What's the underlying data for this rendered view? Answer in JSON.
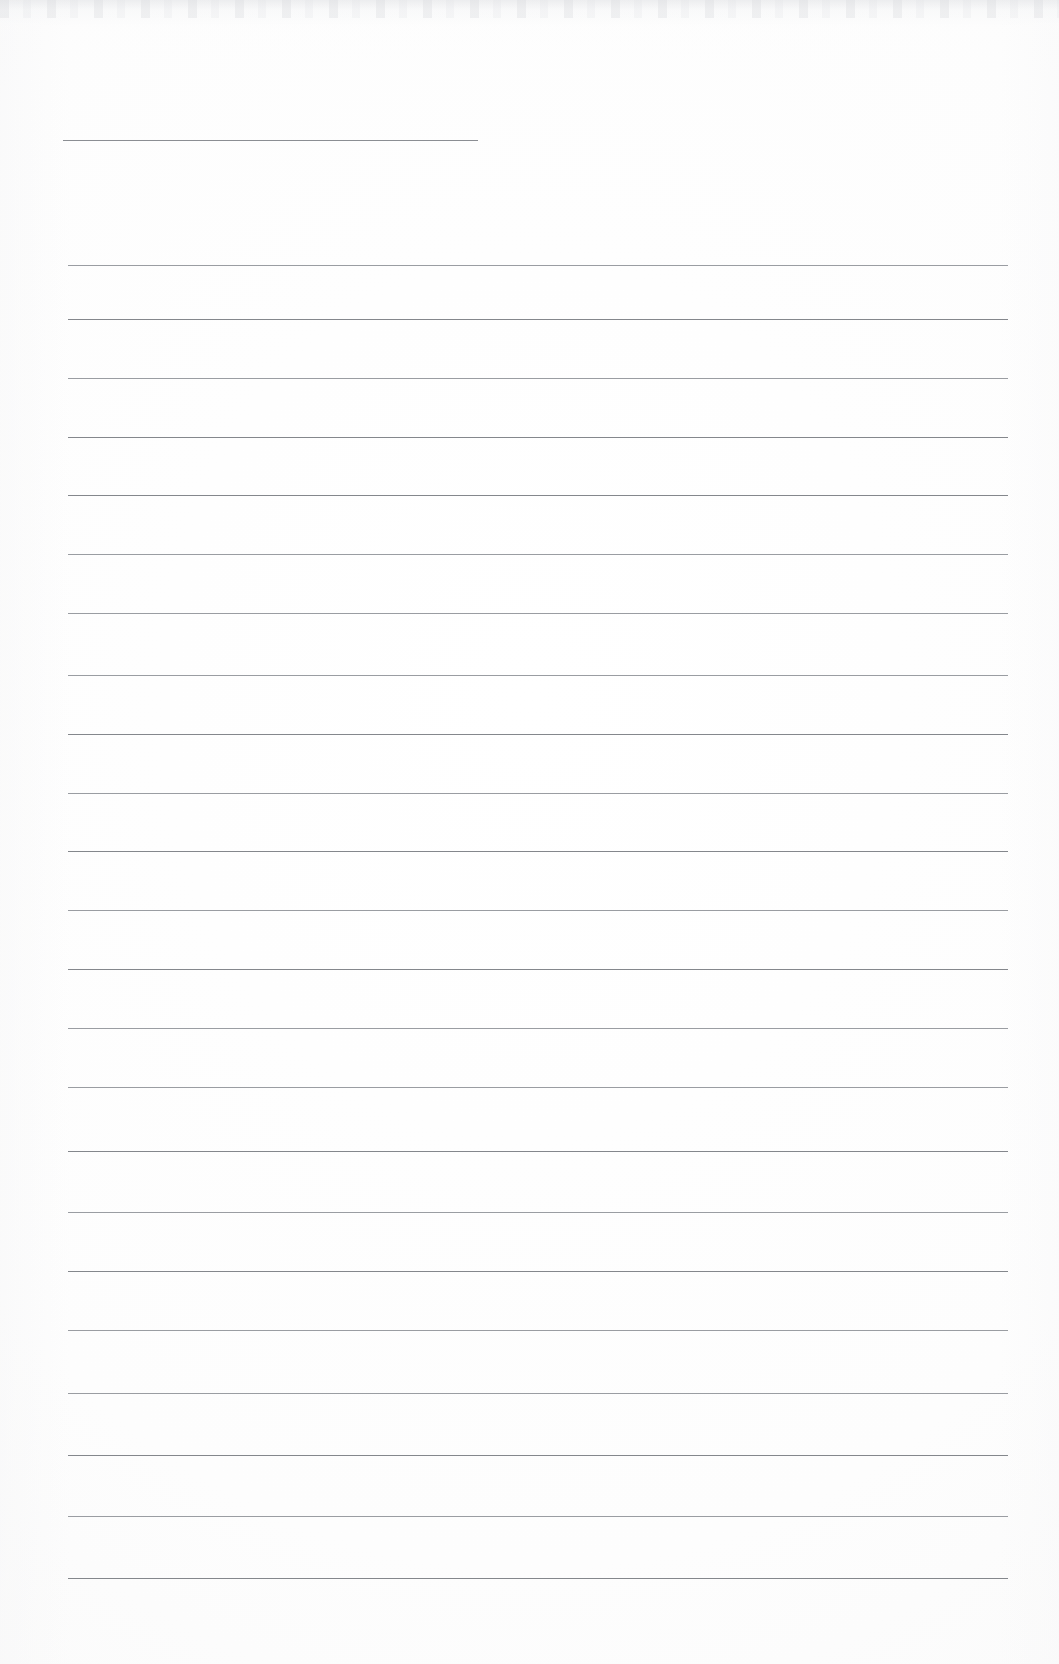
{
  "document": {
    "kind": "scanned-blank-lined-paper",
    "title": "",
    "visible_text": "",
    "page_width": 1059,
    "page_height": 1664,
    "background_color": "#fdfdfd",
    "paper_color": "#ffffff",
    "rule_color_dark": "#84878c",
    "rule_color_light": "#9a9da2",
    "header_rule_color": "#8b8e93"
  },
  "header_rule": {
    "name": "header-rule",
    "x_start": 63,
    "x_end": 478,
    "y": 140,
    "thickness": 1,
    "color": "#8b8e93"
  },
  "ruling": {
    "line_count": 22,
    "x_start": 68,
    "x_end": 1008,
    "first_y": 265,
    "spacing": 63,
    "thickness": 1,
    "lines": [
      {
        "index": 1,
        "y": 265,
        "weight": "light"
      },
      {
        "index": 2,
        "y": 319,
        "weight": "dark"
      },
      {
        "index": 3,
        "y": 378,
        "weight": "light"
      },
      {
        "index": 4,
        "y": 437,
        "weight": "dark"
      },
      {
        "index": 5,
        "y": 495,
        "weight": "dark"
      },
      {
        "index": 6,
        "y": 554,
        "weight": "light"
      },
      {
        "index": 7,
        "y": 613,
        "weight": "light"
      },
      {
        "index": 8,
        "y": 675,
        "weight": "light"
      },
      {
        "index": 9,
        "y": 734,
        "weight": "dark"
      },
      {
        "index": 10,
        "y": 793,
        "weight": "light"
      },
      {
        "index": 11,
        "y": 851,
        "weight": "dark"
      },
      {
        "index": 12,
        "y": 910,
        "weight": "light"
      },
      {
        "index": 13,
        "y": 969,
        "weight": "dark"
      },
      {
        "index": 14,
        "y": 1028,
        "weight": "light"
      },
      {
        "index": 15,
        "y": 1087,
        "weight": "light"
      },
      {
        "index": 16,
        "y": 1151,
        "weight": "dark"
      },
      {
        "index": 17,
        "y": 1212,
        "weight": "light"
      },
      {
        "index": 18,
        "y": 1271,
        "weight": "dark"
      },
      {
        "index": 19,
        "y": 1330,
        "weight": "light"
      },
      {
        "index": 20,
        "y": 1393,
        "weight": "light"
      },
      {
        "index": 21,
        "y": 1455,
        "weight": "dark"
      },
      {
        "index": 22,
        "y": 1516,
        "weight": "light"
      },
      {
        "index": 23,
        "y": 1578,
        "weight": "dark"
      }
    ]
  }
}
